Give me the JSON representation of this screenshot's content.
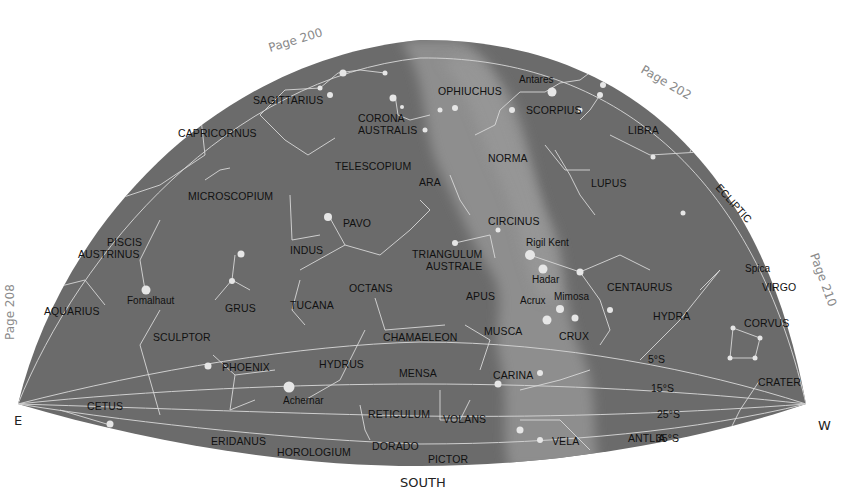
{
  "compass": {
    "east": "E",
    "west": "W",
    "south": "SOUTH"
  },
  "page_refs": [
    {
      "label": "Page 200",
      "x": 270,
      "y": 52,
      "rotate": -17
    },
    {
      "label": "Page 202",
      "x": 640,
      "y": 72,
      "rotate": 30
    },
    {
      "label": "Page 208",
      "x": 14,
      "y": 340,
      "rotate": -90
    },
    {
      "label": "Page 210",
      "x": 810,
      "y": 255,
      "rotate": 70
    }
  ],
  "ecliptic_label": "ECLIPTIC",
  "declination_labels": [
    "5°S",
    "15°S",
    "25°S",
    "35°S"
  ],
  "colors": {
    "sky": "#6b6b6b",
    "milky_way": "#8c8c8c",
    "lines": "#d8d8d8",
    "background": "#ffffff"
  },
  "constellations": [
    {
      "name": "SAGITTARIUS",
      "x": 253,
      "y": 104
    },
    {
      "name": "CORONA",
      "x": 358,
      "y": 122
    },
    {
      "name": "AUSTRALIS",
      "x": 358,
      "y": 134
    },
    {
      "name": "OPHIUCHUS",
      "x": 438,
      "y": 95
    },
    {
      "name": "SCORPIUS",
      "x": 526,
      "y": 114
    },
    {
      "name": "CAPRICORNUS",
      "x": 178,
      "y": 137
    },
    {
      "name": "LIBRA",
      "x": 628,
      "y": 134
    },
    {
      "name": "TELESCOPIUM",
      "x": 335,
      "y": 170
    },
    {
      "name": "NORMA",
      "x": 488,
      "y": 162
    },
    {
      "name": "ARA",
      "x": 419,
      "y": 186
    },
    {
      "name": "LUPUS",
      "x": 591,
      "y": 187
    },
    {
      "name": "MICROSCOPIUM",
      "x": 188,
      "y": 200
    },
    {
      "name": "PAVO",
      "x": 343,
      "y": 227
    },
    {
      "name": "CIRCINUS",
      "x": 488,
      "y": 225
    },
    {
      "name": "PISCIS",
      "x": 107,
      "y": 246
    },
    {
      "name": "AUSTRINUS",
      "x": 78,
      "y": 258
    },
    {
      "name": "INDUS",
      "x": 290,
      "y": 254
    },
    {
      "name": "TRIANGULUM",
      "x": 412,
      "y": 258
    },
    {
      "name": "AUSTRALE",
      "x": 426,
      "y": 270
    },
    {
      "name": "CENTAURUS",
      "x": 607,
      "y": 291
    },
    {
      "name": "VIRGO",
      "x": 762,
      "y": 291
    },
    {
      "name": "OCTANS",
      "x": 349,
      "y": 292
    },
    {
      "name": "APUS",
      "x": 466,
      "y": 300
    },
    {
      "name": "AQUARIUS",
      "x": 44,
      "y": 315
    },
    {
      "name": "GRUS",
      "x": 225,
      "y": 312
    },
    {
      "name": "TUCANA",
      "x": 290,
      "y": 309
    },
    {
      "name": "HYDRA",
      "x": 653,
      "y": 320
    },
    {
      "name": "CORVUS",
      "x": 744,
      "y": 327
    },
    {
      "name": "SCULPTOR",
      "x": 153,
      "y": 341
    },
    {
      "name": "CHAMAELEON",
      "x": 383,
      "y": 341
    },
    {
      "name": "MUSCA",
      "x": 484,
      "y": 335
    },
    {
      "name": "CRUX",
      "x": 559,
      "y": 340
    },
    {
      "name": "PHOENIX",
      "x": 222,
      "y": 371
    },
    {
      "name": "HYDRUS",
      "x": 319,
      "y": 368
    },
    {
      "name": "MENSA",
      "x": 399,
      "y": 377
    },
    {
      "name": "CARINA",
      "x": 493,
      "y": 379
    },
    {
      "name": "CRATER",
      "x": 758,
      "y": 386
    },
    {
      "name": "CETUS",
      "x": 87,
      "y": 410
    },
    {
      "name": "RETICULUM",
      "x": 368,
      "y": 418
    },
    {
      "name": "VOLANS",
      "x": 443,
      "y": 423
    },
    {
      "name": "ERIDANUS",
      "x": 211,
      "y": 445
    },
    {
      "name": "HOROLOGIUM",
      "x": 277,
      "y": 456
    },
    {
      "name": "DORADO",
      "x": 372,
      "y": 450
    },
    {
      "name": "VELA",
      "x": 552,
      "y": 445
    },
    {
      "name": "ANTLIA",
      "x": 628,
      "y": 442
    },
    {
      "name": "PICTOR",
      "x": 428,
      "y": 463
    }
  ],
  "named_stars": [
    {
      "name": "Antares",
      "x": 519,
      "y": 83
    },
    {
      "name": "Rigil Kent",
      "x": 526,
      "y": 246
    },
    {
      "name": "Spica",
      "x": 745,
      "y": 272
    },
    {
      "name": "Hadar",
      "x": 532,
      "y": 283
    },
    {
      "name": "Acrux",
      "x": 520,
      "y": 304
    },
    {
      "name": "Mimosa",
      "x": 554,
      "y": 300
    },
    {
      "name": "Fomalhaut",
      "x": 127,
      "y": 304
    },
    {
      "name": "Achernar",
      "x": 283,
      "y": 404
    }
  ]
}
